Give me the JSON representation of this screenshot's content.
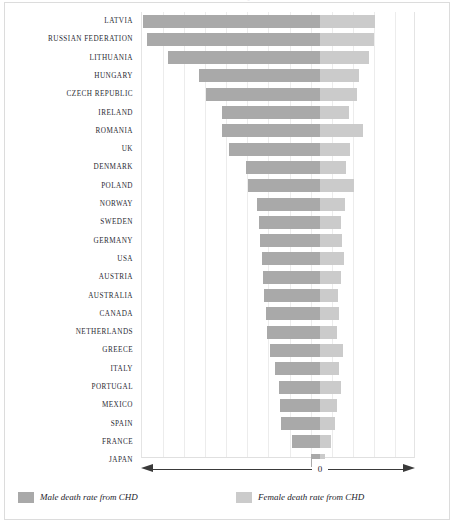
{
  "figure": {
    "title_clipped": "Death rates from coronary heart disease",
    "zero_label": "0",
    "axis_name": "bidirectional-axis"
  },
  "legend": {
    "position": "bottom",
    "items": [
      {
        "label": "Male death rate from CHD",
        "color": "#a9a9a9",
        "swatch": "male-swatch"
      },
      {
        "label": "Female death rate from CHD",
        "color": "#cbcbcb",
        "swatch": "female-swatch"
      }
    ]
  },
  "colors": {
    "male": "#a9a9a9",
    "female": "#cbcbcb",
    "gridline": "#ececec",
    "axis": "#3a3a3a",
    "frame": "#dcdcdc",
    "label_text": "#2a2a33"
  },
  "chart_data": {
    "type": "bar",
    "orientation": "horizontal",
    "subtype": "diverging-bidirectional",
    "title": "Death rates from coronary heart disease",
    "xlabel": "",
    "ylabel": "",
    "grid": true,
    "gridlines_count": 13,
    "zero_position_fraction": 0.653,
    "xlim": [
      -8.2,
      4.4
    ],
    "axis_note": "Male rates extend left of 0, female rates extend right of 0; values are relative units read off evenly spaced gridlines.",
    "categories": [
      "LATVIA",
      "RUSSIAN FEDERATION",
      "LITHUANIA",
      "HUNGARY",
      "CZECH REPUBLIC",
      "IRELAND",
      "ROMANIA",
      "UK",
      "DENMARK",
      "POLAND",
      "NORWAY",
      "SWEDEN",
      "GERMANY",
      "USA",
      "AUSTRIA",
      "AUSTRALIA",
      "CANADA",
      "NETHERLANDS",
      "GREECE",
      "ITALY",
      "PORTUGAL",
      "MEXICO",
      "SPAIN",
      "FRANCE",
      "JAPAN"
    ],
    "series": [
      {
        "name": "Male death rate from CHD",
        "color": "#a9a9a9",
        "direction": "left",
        "values": [
          8.15,
          7.95,
          7.0,
          5.55,
          5.25,
          4.5,
          4.5,
          4.2,
          3.4,
          3.3,
          2.9,
          2.8,
          2.75,
          2.65,
          2.6,
          2.55,
          2.5,
          2.45,
          2.3,
          2.05,
          1.9,
          1.85,
          1.8,
          1.3,
          0.4
        ]
      },
      {
        "name": "Female death rate from CHD",
        "color": "#cbcbcb",
        "direction": "right",
        "values": [
          2.55,
          2.5,
          2.25,
          1.8,
          1.7,
          1.35,
          2.0,
          1.4,
          1.2,
          1.55,
          1.15,
          0.95,
          1.0,
          1.1,
          0.95,
          0.85,
          0.9,
          0.8,
          1.05,
          0.9,
          0.95,
          0.8,
          0.7,
          0.5,
          0.25
        ]
      }
    ],
    "rows": [
      {
        "category": "LATVIA",
        "male": 8.15,
        "female": 2.55
      },
      {
        "category": "RUSSIAN FEDERATION",
        "male": 7.95,
        "female": 2.5
      },
      {
        "category": "LITHUANIA",
        "male": 7.0,
        "female": 2.25
      },
      {
        "category": "HUNGARY",
        "male": 5.55,
        "female": 1.8
      },
      {
        "category": "CZECH REPUBLIC",
        "male": 5.25,
        "female": 1.7
      },
      {
        "category": "IRELAND",
        "male": 4.5,
        "female": 1.35
      },
      {
        "category": "ROMANIA",
        "male": 4.5,
        "female": 2.0
      },
      {
        "category": "UK",
        "male": 4.2,
        "female": 1.4
      },
      {
        "category": "DENMARK",
        "male": 3.4,
        "female": 1.2
      },
      {
        "category": "POLAND",
        "male": 3.3,
        "female": 1.55
      },
      {
        "category": "NORWAY",
        "male": 2.9,
        "female": 1.15
      },
      {
        "category": "SWEDEN",
        "male": 2.8,
        "female": 0.95
      },
      {
        "category": "GERMANY",
        "male": 2.75,
        "female": 1.0
      },
      {
        "category": "USA",
        "male": 2.65,
        "female": 1.1
      },
      {
        "category": "AUSTRIA",
        "male": 2.6,
        "female": 0.95
      },
      {
        "category": "AUSTRALIA",
        "male": 2.55,
        "female": 0.85
      },
      {
        "category": "CANADA",
        "male": 2.5,
        "female": 0.9
      },
      {
        "category": "NETHERLANDS",
        "male": 2.45,
        "female": 0.8
      },
      {
        "category": "GREECE",
        "male": 2.3,
        "female": 1.05
      },
      {
        "category": "ITALY",
        "male": 2.05,
        "female": 0.9
      },
      {
        "category": "PORTUGAL",
        "male": 1.9,
        "female": 0.95
      },
      {
        "category": "MEXICO",
        "male": 1.85,
        "female": 0.8
      },
      {
        "category": "SPAIN",
        "male": 1.8,
        "female": 0.7
      },
      {
        "category": "FRANCE",
        "male": 1.3,
        "female": 0.5
      },
      {
        "category": "JAPAN",
        "male": 0.4,
        "female": 0.25
      }
    ]
  }
}
